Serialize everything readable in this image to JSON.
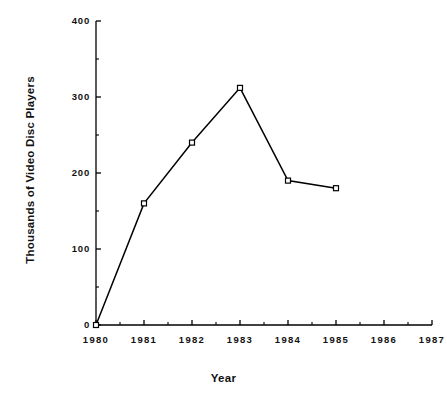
{
  "chart_data": {
    "type": "line",
    "title": "",
    "xlabel": "Year",
    "ylabel": "Thousands of Video Disc Players",
    "x": [
      1980,
      1981,
      1982,
      1983,
      1984,
      1985
    ],
    "values": [
      0,
      160,
      240,
      312,
      190,
      180
    ],
    "series": [
      {
        "name": "Video Disc Players",
        "values": [
          0,
          160,
          240,
          312,
          190,
          180
        ]
      }
    ],
    "points": [
      {
        "x": 1980,
        "y": 0
      },
      {
        "x": 1981,
        "y": 160
      },
      {
        "x": 1982,
        "y": 240
      },
      {
        "x": 1983,
        "y": 312
      },
      {
        "x": 1984,
        "y": 190
      },
      {
        "x": 1985,
        "y": 180
      }
    ],
    "xlim": [
      1980,
      1987
    ],
    "ylim": [
      0,
      400
    ],
    "xticks": [
      1980,
      1981,
      1982,
      1983,
      1984,
      1985,
      1986,
      1987
    ],
    "xtick_labels": [
      "1980",
      "1981",
      "1982",
      "1983",
      "1984",
      "1985",
      "1986",
      "1987"
    ],
    "yticks": [
      0,
      100,
      200,
      300,
      400
    ],
    "ytick_labels": [
      "0",
      "100",
      "200",
      "300",
      "400"
    ],
    "x_minor_ticks": [
      1980.5,
      1981.5,
      1982.5,
      1983.5,
      1984.5,
      1985.5,
      1986.5
    ],
    "y_minor_ticks": [
      50,
      150,
      250,
      350
    ],
    "grid": false,
    "legend": false,
    "marker": "open-square",
    "line_color": "#000000",
    "marker_face_color": "#ffffff",
    "marker_edge_color": "#000000",
    "background_color": "#ffffff"
  }
}
